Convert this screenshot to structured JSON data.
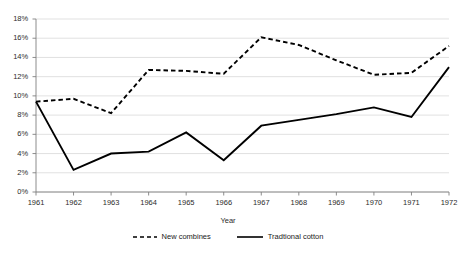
{
  "chart_data": {
    "type": "line",
    "title": "",
    "subtitle": "",
    "xlabel": "Year",
    "ylabel": "",
    "categories": [
      "1961",
      "1962",
      "1963",
      "1964",
      "1965",
      "1966",
      "1967",
      "1968",
      "1969",
      "1970",
      "1971",
      "1972"
    ],
    "x": [
      1961,
      1962,
      1963,
      1964,
      1965,
      1966,
      1967,
      1968,
      1969,
      1970,
      1971,
      1972
    ],
    "series": [
      {
        "name": "New combines",
        "style": "dashed",
        "color": "#000000",
        "values": [
          9.4,
          9.7,
          8.2,
          12.7,
          12.6,
          12.3,
          16.1,
          15.3,
          13.7,
          12.2,
          12.4,
          15.2
        ]
      },
      {
        "name": "Tradtional cotton",
        "style": "solid",
        "color": "#000000",
        "values": [
          9.4,
          2.3,
          4.0,
          4.2,
          6.2,
          3.3,
          6.9,
          7.5,
          8.1,
          8.8,
          7.8,
          13.0
        ]
      }
    ],
    "ylim": [
      0,
      18
    ],
    "ytick_values": [
      0,
      2,
      4,
      6,
      8,
      10,
      12,
      14,
      16,
      18
    ],
    "ytick_labels": [
      "0%",
      "2%",
      "4%",
      "6%",
      "8%",
      "10%",
      "12%",
      "14%",
      "16%",
      "18%"
    ],
    "xtick_labels": [
      "1961",
      "1962",
      "1963",
      "1964",
      "1965",
      "1966",
      "1967",
      "1968",
      "1969",
      "1970",
      "1971",
      "1972"
    ],
    "grid": true,
    "grid_axis": "y",
    "grid_color": "#d9d9d9",
    "axis_color": "#808080",
    "legend_position": "bottom",
    "legend": [
      "New combines",
      "Tradtional cotton"
    ],
    "background": "#ffffff"
  },
  "axis": {
    "y_title": "",
    "x_title": "Year"
  }
}
